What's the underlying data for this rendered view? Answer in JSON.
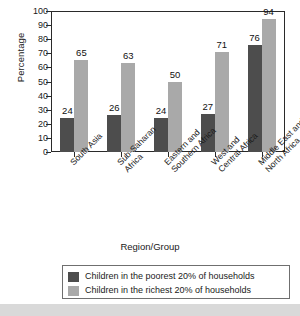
{
  "chart_data": {
    "type": "bar",
    "title": "",
    "xlabel": "Region/Group",
    "ylabel": "Percentage",
    "ylim": [
      0,
      100
    ],
    "ytick_values": [
      0,
      10,
      20,
      30,
      40,
      50,
      60,
      70,
      80,
      90,
      100
    ],
    "grid": false,
    "legend_position": "bottom",
    "categories": [
      "South Asia",
      "Sub-Saharan Africa",
      "Eastern and Southern Africa",
      "West and Central Africa",
      "Middle East and North Africa"
    ],
    "category_lines": [
      [
        "South Asia"
      ],
      [
        "Sub-Saharan",
        "Africa"
      ],
      [
        "Eastern and",
        "Southern Africa"
      ],
      [
        "West and",
        "Central Africa"
      ],
      [
        "Middle East and",
        "North Africa"
      ]
    ],
    "series": [
      {
        "name": "Children in the poorest 20% of households",
        "color": "#4d4d4d",
        "values": [
          24,
          26,
          24,
          27,
          76
        ]
      },
      {
        "name": "Children in the richest 20% of households",
        "color": "#a9a9a9",
        "values": [
          65,
          63,
          50,
          71,
          94
        ]
      }
    ]
  },
  "legend": {
    "items": [
      {
        "label": "Children in the poorest 20% of households"
      },
      {
        "label": "Children in the richest 20% of households"
      }
    ]
  },
  "axes": {
    "y_title": "Percentage",
    "x_title": "Region/Group"
  }
}
